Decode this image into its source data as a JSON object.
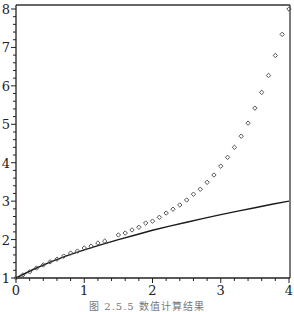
{
  "chart_data": {
    "type": "line",
    "title": "",
    "xlabel": "",
    "ylabel": "",
    "xlim": [
      0,
      4
    ],
    "ylim": [
      1,
      8
    ],
    "grid": false,
    "legend": null,
    "x_ticks": [
      0,
      1,
      2,
      3,
      4
    ],
    "y_ticks": [
      1,
      2,
      3,
      4,
      5,
      6,
      7,
      8
    ],
    "x_tick_labels": [
      "0",
      "1",
      "2",
      "3",
      "4"
    ],
    "y_tick_labels": [
      "1",
      "2",
      "3",
      "4",
      "5",
      "6",
      "7",
      "8"
    ],
    "series": [
      {
        "name": "exact solution (solid line)",
        "style": "line",
        "color": "#1a1a1a",
        "x": [
          0,
          0.25,
          0.5,
          0.75,
          1,
          1.25,
          1.5,
          1.75,
          2,
          2.25,
          2.5,
          2.75,
          3,
          3.25,
          3.5,
          3.75,
          4
        ],
        "values": [
          1.0,
          1.22,
          1.41,
          1.58,
          1.73,
          1.87,
          2.0,
          2.12,
          2.24,
          2.35,
          2.45,
          2.55,
          2.65,
          2.74,
          2.83,
          2.92,
          3.0
        ]
      },
      {
        "name": "numerical result (diamond markers)",
        "style": "markers",
        "color": "#555555",
        "x": [
          0,
          0.1,
          0.2,
          0.3,
          0.4,
          0.5,
          0.6,
          0.7,
          0.8,
          0.9,
          1.0,
          1.1,
          1.2,
          1.3,
          1.5,
          1.6,
          1.7,
          1.8,
          1.9,
          2.0,
          2.1,
          2.2,
          2.3,
          2.4,
          2.5,
          2.6,
          2.7,
          2.8,
          2.9,
          3.0,
          3.1,
          3.2,
          3.3,
          3.4,
          3.5,
          3.6,
          3.7,
          3.8,
          3.9,
          4.0
        ],
        "values": [
          1.0,
          1.08,
          1.16,
          1.26,
          1.34,
          1.42,
          1.49,
          1.57,
          1.65,
          1.7,
          1.78,
          1.83,
          1.91,
          1.96,
          2.12,
          2.17,
          2.25,
          2.32,
          2.43,
          2.48,
          2.58,
          2.69,
          2.79,
          2.9,
          3.03,
          3.18,
          3.31,
          3.49,
          3.68,
          3.91,
          4.14,
          4.4,
          4.69,
          5.03,
          5.42,
          5.83,
          6.27,
          6.79,
          7.34,
          8.0
        ]
      }
    ]
  },
  "caption": "图 2.5.5   数值计算结果"
}
